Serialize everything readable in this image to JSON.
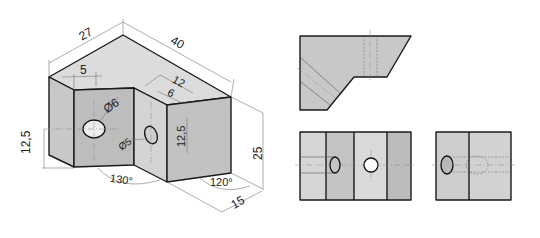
{
  "figure": {
    "colors": {
      "face_top": "#dcdcdc",
      "face_left": "#c8c8c8",
      "face_front_left": "#bdbdbd",
      "face_notch_wall": "#d4d4d4",
      "face_right": "#c2c2c2",
      "view_light": "#d6d6d6",
      "view_medium": "#c4c4c4",
      "view_light2": "#dadada",
      "view_dark": "#bcbcbc",
      "edge": "#1a1a1a"
    }
  },
  "isometric_view": {
    "dimensions": {
      "width_27": "27",
      "length_40": "40",
      "offset_5": "5",
      "notch_12": "12",
      "notch_6": "6",
      "hole_dia_6": "Ø6",
      "hole_dia_5": "Ø5",
      "height_left_12_5": "12,5",
      "height_mid_12_5": "12,5",
      "height_25": "25",
      "depth_15": "15",
      "angle_130": "130°",
      "angle_120": "120°"
    }
  },
  "orthographic_views": {
    "top_view": {
      "label": "Top view"
    },
    "front_view": {
      "label": "Front view"
    },
    "side_view": {
      "label": "Side view"
    }
  }
}
